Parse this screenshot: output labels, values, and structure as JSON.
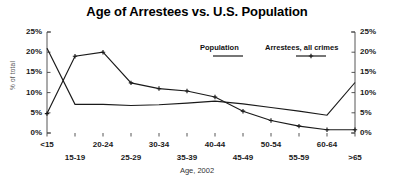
{
  "chart_data": {
    "type": "line",
    "title": "Age of Arrestees vs. U.S. Population",
    "xlabel": "Age, 2002",
    "ylabel": "% of total",
    "categories": [
      "<15",
      "15-19",
      "20-24",
      "25-29",
      "30-34",
      "35-39",
      "40-44",
      "45-49",
      "50-54",
      "55-59",
      "60-64",
      ">65"
    ],
    "series": [
      {
        "name": "Population",
        "marker": "none",
        "values": [
          21.0,
          7.1,
          7.1,
          6.8,
          7.0,
          7.4,
          7.9,
          7.2,
          6.3,
          5.4,
          4.4,
          12.5
        ]
      },
      {
        "name": "Arrestees, all crimes",
        "marker": "plus",
        "values": [
          4.8,
          19.0,
          20.0,
          12.4,
          11.0,
          10.4,
          8.9,
          5.4,
          3.1,
          1.7,
          0.8,
          0.8
        ]
      }
    ],
    "ylim": [
      0,
      25
    ],
    "ytick_values": [
      0,
      5,
      10,
      15,
      20,
      25
    ],
    "ytick_labels": [
      "0%",
      "5%",
      "10%",
      "15%",
      "20%",
      "25%"
    ],
    "ytick_labels_right": [
      "0%",
      "5%",
      "10%",
      "15%",
      "20%",
      "25%"
    ],
    "grid": false,
    "legend_position": "upper-right-inside",
    "dual_axis": true,
    "line_color": "#1a1a1a"
  },
  "legend": {
    "population_label": "Population",
    "arrestees_label": "Arrestees, all crimes"
  }
}
